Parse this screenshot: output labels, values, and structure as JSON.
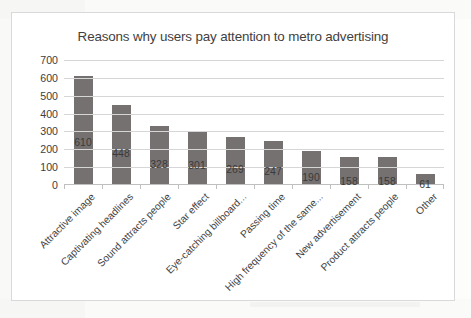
{
  "chart": {
    "title": "Reasons why users pay attention to metro advertising"
  },
  "chart_data": {
    "type": "bar",
    "title": "Reasons why users pay attention to metro advertising",
    "xlabel": "",
    "ylabel": "",
    "ylim": [
      0,
      700
    ],
    "ytick_labels": [
      "700",
      "600",
      "500",
      "400",
      "300",
      "200",
      "100",
      "0"
    ],
    "yticks": [
      700,
      600,
      500,
      400,
      300,
      200,
      100,
      0
    ],
    "grid": true,
    "legend": false,
    "bar_color": "#767171",
    "categories": [
      "Attractive image",
      "Captivating headlines",
      "Sound attracts people",
      "Star effect",
      "Eye-catching billboard...",
      "Passing time",
      "High frequency of the same...",
      "New advertisement",
      "Product attracts people",
      "Other"
    ],
    "values": [
      610,
      448,
      328,
      301,
      269,
      247,
      190,
      158,
      158,
      61
    ],
    "value_labels": [
      "610",
      "448",
      "328",
      "301",
      "269",
      "247",
      "190",
      "158",
      "158",
      "61"
    ]
  }
}
